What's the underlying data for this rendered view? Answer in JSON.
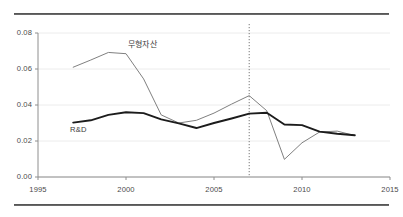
{
  "figure": {
    "top_rule": "horizontal-rule",
    "bottom_rule": "horizontal-rule"
  },
  "chart_data": {
    "type": "line",
    "title": "",
    "subtitle": "",
    "xlabel": "",
    "ylabel": "",
    "xlim": [
      1995,
      2015
    ],
    "ylim": [
      0.0,
      0.08
    ],
    "grid": true,
    "grid_axis": "y",
    "legend": "inline-labels",
    "x_ticks": [
      "1995",
      "2000",
      "2005",
      "2010",
      "2015"
    ],
    "x_tick_values": [
      1995,
      2000,
      2005,
      2010,
      2015
    ],
    "y_ticks": [
      "0.00",
      "0.02",
      "0.04",
      "0.06",
      "0.08"
    ],
    "y_tick_values": [
      0.0,
      0.02,
      0.04,
      0.06,
      0.08
    ],
    "annotations": [
      {
        "name": "reference-line-2007",
        "type": "vline",
        "x": 2007,
        "style": "dotted",
        "color": "#777777"
      }
    ],
    "series": [
      {
        "name": "무형자산",
        "label": "무형자산",
        "color": "#808080",
        "width": 1,
        "x": [
          1997,
          1998,
          1999,
          2000,
          2001,
          2002,
          2003,
          2004,
          2005,
          2006,
          2007,
          2008,
          2009,
          2010,
          2011,
          2012,
          2013
        ],
        "values": [
          0.061,
          0.065,
          0.0692,
          0.0685,
          0.0545,
          0.0345,
          0.03,
          0.0315,
          0.0355,
          0.0405,
          0.0452,
          0.0368,
          0.0098,
          0.019,
          0.025,
          0.0255,
          0.023
        ]
      },
      {
        "name": "R&D",
        "label": "R&D",
        "color": "#1c1c1c",
        "width": 1.9,
        "x": [
          1997,
          1998,
          1999,
          2000,
          2001,
          2002,
          2003,
          2004,
          2005,
          2006,
          2007,
          2008,
          2009,
          2010,
          2011,
          2012,
          2013
        ],
        "values": [
          0.0302,
          0.0315,
          0.0345,
          0.036,
          0.0355,
          0.032,
          0.0298,
          0.0272,
          0.03,
          0.0325,
          0.0352,
          0.0357,
          0.0292,
          0.0288,
          0.0252,
          0.024,
          0.0232
        ]
      }
    ]
  }
}
